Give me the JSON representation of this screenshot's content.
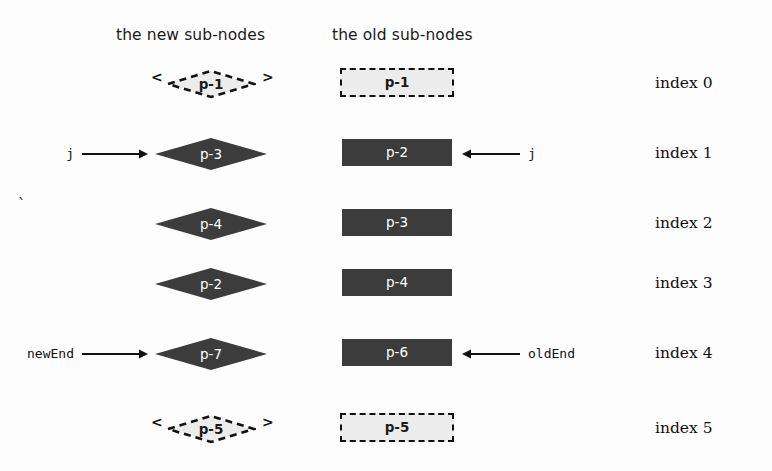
{
  "diagram": {
    "title_new_column": "the new sub-nodes",
    "title_old_column": "the old sub-nodes",
    "stray_mark": "`",
    "rows": [
      {
        "index_label": "index 0",
        "new_node": {
          "label": "p-1",
          "shape": "diamond",
          "state": "ghost",
          "angle_left": "<",
          "angle_right": ">"
        },
        "old_node": {
          "label": "p-1",
          "shape": "rect",
          "state": "ghost"
        },
        "new_pointer": "",
        "old_pointer": ""
      },
      {
        "index_label": "index 1",
        "new_node": {
          "label": "p-3",
          "shape": "diamond",
          "state": "solid"
        },
        "old_node": {
          "label": "p-2",
          "shape": "rect",
          "state": "solid"
        },
        "new_pointer": "j",
        "old_pointer": "j"
      },
      {
        "index_label": "index 2",
        "new_node": {
          "label": "p-4",
          "shape": "diamond",
          "state": "solid"
        },
        "old_node": {
          "label": "p-3",
          "shape": "rect",
          "state": "solid"
        },
        "new_pointer": "",
        "old_pointer": ""
      },
      {
        "index_label": "index 3",
        "new_node": {
          "label": "p-2",
          "shape": "diamond",
          "state": "solid"
        },
        "old_node": {
          "label": "p-4",
          "shape": "rect",
          "state": "solid"
        },
        "new_pointer": "",
        "old_pointer": ""
      },
      {
        "index_label": "index 4",
        "new_node": {
          "label": "p-7",
          "shape": "diamond",
          "state": "solid"
        },
        "old_node": {
          "label": "p-6",
          "shape": "rect",
          "state": "solid"
        },
        "new_pointer": "newEnd",
        "old_pointer": "oldEnd"
      },
      {
        "index_label": "index 5",
        "new_node": {
          "label": "p-5",
          "shape": "diamond",
          "state": "ghost",
          "angle_left": "<",
          "angle_right": ">"
        },
        "old_node": {
          "label": "p-5",
          "shape": "rect",
          "state": "ghost"
        },
        "new_pointer": "",
        "old_pointer": ""
      }
    ],
    "colors": {
      "node_fill": "#3c3c3c",
      "node_text": "#ffffff",
      "ghost_fill": "#ececec",
      "ghost_border": "#111111",
      "background": "#fdfdfd",
      "arrow": "#111111"
    }
  }
}
